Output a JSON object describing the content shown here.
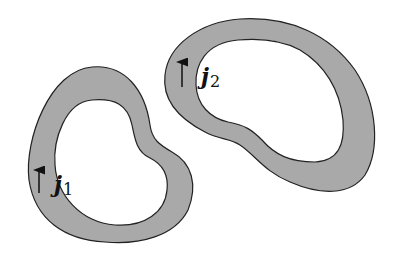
{
  "diagram": {
    "colors": {
      "band_fill": "#a9a9a9",
      "outline": "#222222",
      "background": "#ffffff"
    },
    "loops": [
      {
        "id": "loop-1",
        "label_main": "j",
        "label_sub": "1",
        "arrow_direction": "up"
      },
      {
        "id": "loop-2",
        "label_main": "j",
        "label_sub": "2",
        "arrow_direction": "up"
      }
    ]
  }
}
